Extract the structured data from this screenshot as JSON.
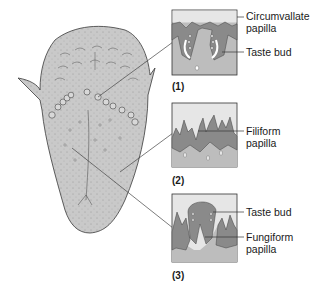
{
  "diagram": {
    "colors": {
      "tongue_fill": "#c9c9c9",
      "tissue_dark": "#8a8a8a",
      "box_bg": "#bdbdbd",
      "box_top": "#e6e6e6",
      "outline": "#3a3a3a",
      "leader_line": "#444444"
    },
    "insets": [
      {
        "number": "(1)",
        "labels": [
          {
            "line1": "Circumvallate",
            "line2": "papilla"
          },
          {
            "line1": "Taste bud",
            "line2": ""
          }
        ]
      },
      {
        "number": "(2)",
        "labels": [
          {
            "line1": "Filiform",
            "line2": "papilla"
          }
        ]
      },
      {
        "number": "(3)",
        "labels": [
          {
            "line1": "Taste bud",
            "line2": ""
          },
          {
            "line1": "Fungiform",
            "line2": "papilla"
          }
        ]
      }
    ]
  }
}
